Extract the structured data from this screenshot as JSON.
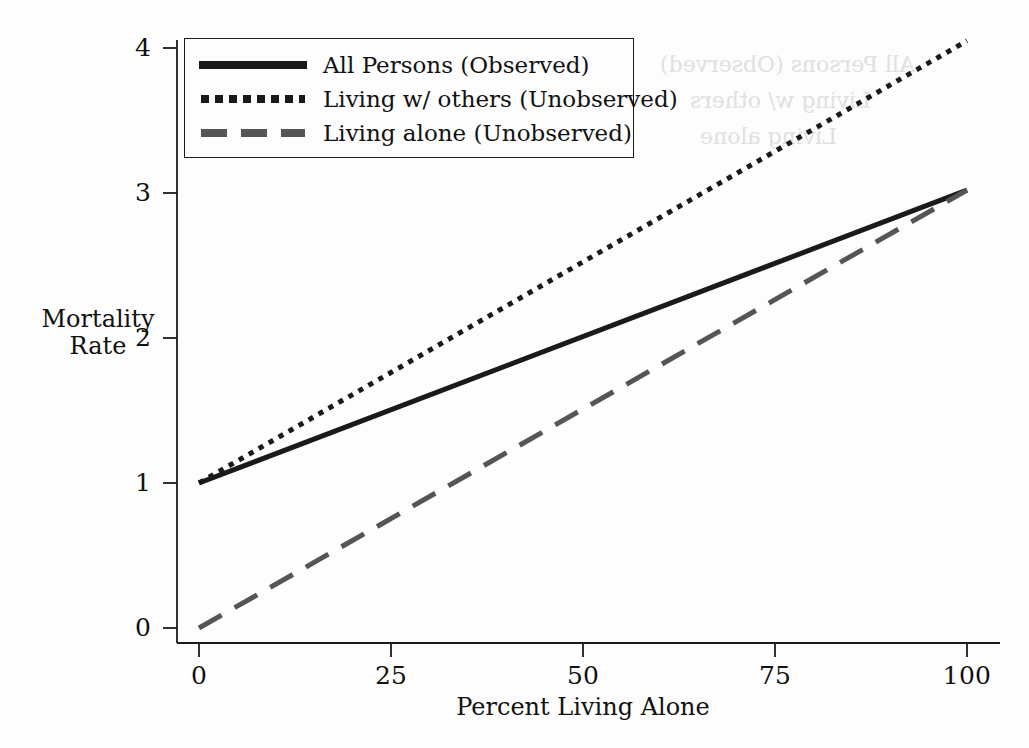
{
  "figure": {
    "background_color": "#fdfdfd",
    "axis_color": "#1a1a1a"
  },
  "chart_data": {
    "type": "line",
    "title": "",
    "xlabel": "Percent Living Alone",
    "ylabel": "Mortality Rate",
    "ylabel_lines": [
      "Mortality",
      "Rate"
    ],
    "xlim": [
      0,
      100
    ],
    "ylim": [
      0,
      4.2
    ],
    "xticks": [
      0,
      25,
      50,
      75,
      100
    ],
    "yticks": [
      0,
      1,
      2,
      3,
      4
    ],
    "xtick_labels": [
      "0",
      "25",
      "50",
      "75",
      "100"
    ],
    "ytick_labels": [
      "0",
      "1",
      "2",
      "3",
      "4"
    ],
    "grid": false,
    "legend_position": "upper left",
    "x": [
      0,
      100
    ],
    "series": [
      {
        "name": "All Persons (Observed)",
        "style": "solid",
        "color": "#1a1a1a",
        "width": 5,
        "values": [
          1.0,
          3.02
        ]
      },
      {
        "name": "Living w/ others (Unobserved)",
        "style": "dotted",
        "color": "#1a1a1a",
        "width": 5,
        "values": [
          1.0,
          4.05
        ]
      },
      {
        "name": "Living alone (Unobserved)",
        "style": "dashed",
        "color": "#555555",
        "width": 5,
        "values": [
          0.0,
          3.02
        ]
      }
    ]
  },
  "legend": {
    "items": [
      {
        "label": "All Persons (Observed)"
      },
      {
        "label": "Living w/ others (Unobserved)"
      },
      {
        "label": "Living alone (Unobserved)"
      }
    ]
  },
  "bleed_through": {
    "line1": "All Persons (Observed)",
    "line2": "Living w/ others",
    "line3": "Living alone"
  }
}
